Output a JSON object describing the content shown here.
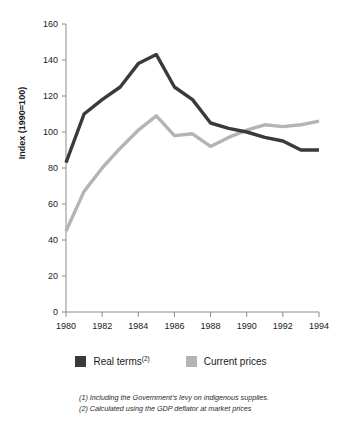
{
  "chart_data": {
    "type": "line",
    "title": "",
    "subtitle": "",
    "xlabel": "",
    "ylabel": "Index (1990=100)",
    "ylabel_parts": {
      "main": "Index (1990=100)"
    },
    "x": [
      1980,
      1981,
      1982,
      1983,
      1984,
      1985,
      1986,
      1987,
      1988,
      1989,
      1990,
      1991,
      1992,
      1993,
      1994
    ],
    "xlim": [
      1980,
      1994
    ],
    "ylim": [
      0,
      160
    ],
    "xticks": [
      1980,
      1982,
      1984,
      1986,
      1988,
      1990,
      1992,
      1994
    ],
    "xtick_labels": [
      "1980",
      "1982",
      "1984",
      "1986",
      "1988",
      "1990",
      "1992",
      "1994"
    ],
    "yticks": [
      0,
      20,
      40,
      60,
      80,
      100,
      120,
      140,
      160
    ],
    "ytick_labels": [
      "0",
      "20",
      "40",
      "60",
      "80",
      "100",
      "120",
      "140",
      "160"
    ],
    "grid": false,
    "legend_position": "bottom",
    "series": [
      {
        "name": "Real terms",
        "name_superscript": "(2)",
        "color": "#3a3a3a",
        "values": [
          83,
          110,
          118,
          125,
          138,
          143,
          125,
          118,
          105,
          102,
          100,
          97,
          95,
          90,
          90
        ]
      },
      {
        "name": "Current prices",
        "name_superscript": "",
        "color": "#b4b4b4",
        "values": [
          45,
          67,
          80,
          91,
          101,
          109,
          98,
          99,
          92,
          97,
          101,
          104,
          103,
          104,
          106
        ]
      }
    ]
  },
  "legend": {
    "items": [
      {
        "label": "Real terms",
        "superscript": "(2)",
        "color": "#3a3a3a"
      },
      {
        "label": "Current prices",
        "superscript": "",
        "color": "#b4b4b4"
      }
    ]
  },
  "footnotes": [
    "(1) Including the Government's levy on indigenous supplies.",
    "(2) Calculated using the GDP deflator at market prices"
  ]
}
